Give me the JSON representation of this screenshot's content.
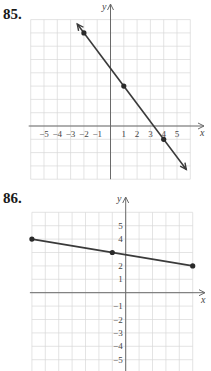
{
  "chart_data": [
    {
      "id": "85",
      "label": "85.",
      "type": "line",
      "title": "",
      "xlabel": "x",
      "ylabel": "y",
      "xlim": [
        -6,
        6
      ],
      "ylim": [
        -4,
        8
      ],
      "grid": true,
      "x_tick_labels": [
        "−5",
        "−4",
        "−3",
        "−2",
        "−1",
        "1",
        "2",
        "3",
        "4",
        "5"
      ],
      "x_ticks": [
        -5,
        -4,
        -3,
        -2,
        -1,
        1,
        2,
        3,
        4,
        5
      ],
      "y_tick_labels": [],
      "points": [
        {
          "x": -2,
          "y": 7
        },
        {
          "x": 1,
          "y": 3
        },
        {
          "x": 4,
          "y": -1
        }
      ],
      "series": [
        {
          "name": "line",
          "slope": -1.3333,
          "intercept": 4.3333,
          "x": [
            -2.5,
            5.7
          ],
          "arrows": "both"
        }
      ]
    },
    {
      "id": "86",
      "label": "86.",
      "type": "line",
      "title": "",
      "xlabel": "x",
      "ylabel": "y",
      "xlim": [
        -7,
        5
      ],
      "ylim": [
        -6,
        6
      ],
      "grid": true,
      "x_tick_labels": [],
      "y_tick_labels": [
        "5",
        "4",
        "2",
        "1",
        "−1",
        "−2",
        "−3",
        "−4",
        "−5"
      ],
      "y_ticks": [
        5,
        4,
        2,
        1,
        -1,
        -2,
        -3,
        -4,
        -5
      ],
      "points": [
        {
          "x": -7,
          "y": 4
        },
        {
          "x": -1,
          "y": 3
        },
        {
          "x": 5,
          "y": 2
        }
      ],
      "series": [
        {
          "name": "segment",
          "slope": -0.1667,
          "intercept": 2.8333,
          "x": [
            -7,
            5
          ],
          "arrows": "none"
        }
      ]
    }
  ]
}
